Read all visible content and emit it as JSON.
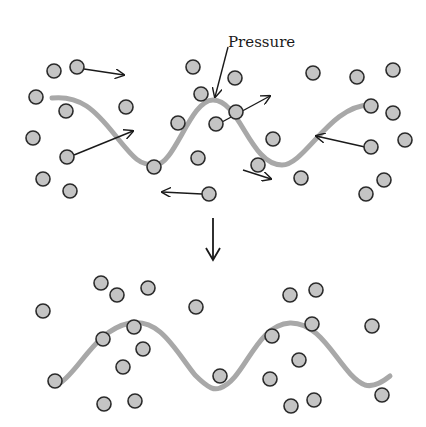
{
  "label": {
    "text": "Pressure",
    "x": 228,
    "y": 47
  },
  "colors": {
    "particle_fill": "#c4c4c4",
    "particle_stroke": "#2a2a2a",
    "wave": "#a8a8a8",
    "arrow": "#1a1a1a",
    "background": "#ffffff"
  },
  "top_panel": {
    "wave_path": "M 52 98 C 80 95, 95 110, 115 135 C 135 160, 140 165, 155 165 C 175 165, 190 100, 213 100 C 240 100, 250 165, 282 165 C 305 165, 330 105, 370 105",
    "particles": [
      [
        54,
        71
      ],
      [
        77,
        67
      ],
      [
        36,
        97
      ],
      [
        66,
        111
      ],
      [
        126,
        107
      ],
      [
        33,
        138
      ],
      [
        67,
        157
      ],
      [
        43,
        179
      ],
      [
        70,
        191
      ],
      [
        154,
        167
      ],
      [
        193,
        67
      ],
      [
        235,
        78
      ],
      [
        201,
        94
      ],
      [
        178,
        123
      ],
      [
        216,
        124
      ],
      [
        198,
        158
      ],
      [
        236,
        112
      ],
      [
        258,
        165
      ],
      [
        273,
        139
      ],
      [
        313,
        73
      ],
      [
        357,
        77
      ],
      [
        393,
        70
      ],
      [
        371,
        106
      ],
      [
        393,
        113
      ],
      [
        405,
        140
      ],
      [
        371,
        147
      ],
      [
        384,
        180
      ],
      [
        366,
        194
      ],
      [
        301,
        178
      ],
      [
        209,
        194
      ]
    ],
    "motion_arrows": [
      {
        "from": [
          84,
          69
        ],
        "to": [
          124,
          75
        ]
      },
      {
        "from": [
          74,
          155
        ],
        "to": [
          133,
          131
        ]
      },
      {
        "from": [
          222,
          122
        ],
        "to": [
          270,
          96
        ]
      },
      {
        "from": [
          365,
          147
        ],
        "to": [
          316,
          136
        ]
      },
      {
        "from": [
          243,
          170
        ],
        "to": [
          271,
          179
        ]
      },
      {
        "from": [
          202,
          194
        ],
        "to": [
          162,
          192
        ]
      }
    ],
    "pressure_pointer": {
      "from": [
        228,
        47
      ],
      "to": [
        215,
        97
      ]
    }
  },
  "transition_arrow": {
    "from": [
      213,
      218
    ],
    "to": [
      213,
      260
    ]
  },
  "bottom_panel": {
    "wave_path": "M 60 383 C 80 370, 95 330, 130 323 C 160 318, 175 350, 195 375 C 210 390, 215 390, 220 388 C 245 380, 255 325, 290 323 C 325 322, 340 375, 365 385 C 375 388, 385 380, 390 376",
    "particles": [
      [
        101,
        283
      ],
      [
        117,
        295
      ],
      [
        148,
        288
      ],
      [
        43,
        311
      ],
      [
        196,
        307
      ],
      [
        134,
        327
      ],
      [
        103,
        339
      ],
      [
        143,
        349
      ],
      [
        123,
        367
      ],
      [
        55,
        381
      ],
      [
        104,
        404
      ],
      [
        135,
        401
      ],
      [
        290,
        295
      ],
      [
        316,
        290
      ],
      [
        312,
        324
      ],
      [
        372,
        326
      ],
      [
        272,
        336
      ],
      [
        299,
        360
      ],
      [
        220,
        376
      ],
      [
        270,
        379
      ],
      [
        291,
        406
      ],
      [
        314,
        400
      ],
      [
        382,
        395
      ]
    ]
  }
}
